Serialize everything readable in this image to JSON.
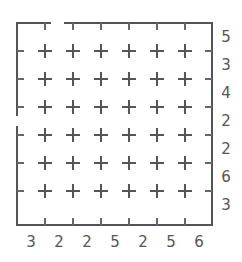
{
  "puzzle": {
    "type": "edge-clue grid puzzle",
    "rows": 7,
    "cols": 7,
    "right_clues": [
      "5",
      "3",
      "4",
      "2",
      "2",
      "6",
      "3"
    ],
    "bottom_clues": [
      "3",
      "2",
      "2",
      "5",
      "2",
      "5",
      "6"
    ],
    "openings": [
      {
        "side": "top",
        "between_cols": [
          1,
          2
        ]
      },
      {
        "side": "left",
        "between_rows": [
          3,
          4
        ]
      }
    ],
    "colors": {
      "line": "#555555",
      "background": "#ffffff"
    }
  }
}
